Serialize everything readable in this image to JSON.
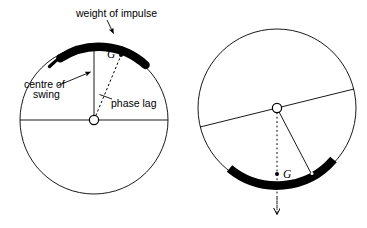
{
  "figure": {
    "background_color": "#ffffff",
    "stroke_color": "#000000",
    "arc_color": "#000000",
    "labels": {
      "weight_of_impulse": "weight of impulse",
      "centre_of_swing_line1": "centre of",
      "centre_of_swing_line2": "swing",
      "phase_lag": "phase lag",
      "centre_of_mass_left": "G",
      "centre_of_mass_right": "G"
    },
    "left_diagram": {
      "name": "upright-flywheel",
      "circle": {
        "cx": 94,
        "cy": 120,
        "r": 74
      },
      "hub": {
        "cx": 94,
        "cy": 120,
        "r": 4.6
      },
      "horizontal_diameter": {
        "x1": 20,
        "y1": 120,
        "x2": 168,
        "y2": 120
      },
      "vertical_radius": {
        "x1": 94,
        "y1": 120,
        "x2": 94,
        "y2": 46
      },
      "impulse_arc": {
        "start_deg": 118,
        "end_deg": 42,
        "thickness": 8
      },
      "g_dot": {
        "cx": 121,
        "cy": 55,
        "r": 2.0
      },
      "g_label": {
        "x": 107,
        "y": 58
      },
      "phase_lag_dashed": {
        "x1": 94,
        "y1": 120,
        "x2": 121,
        "y2": 55
      },
      "phase_lag_tick": {
        "x1": 100,
        "y1": 95,
        "x2": 112,
        "y2": 99
      },
      "weight_label": {
        "x": 76,
        "y": 17
      },
      "weight_arrow": {
        "x1": 108,
        "y1": 20,
        "x2": 114,
        "y2": 34
      },
      "centre_label": {
        "x": 24,
        "y": 88
      },
      "centre_arrow": {
        "x1": 58,
        "y1": 85,
        "x2": 91,
        "y2": 72
      },
      "phase_label": {
        "x": 111,
        "y": 107
      }
    },
    "right_diagram": {
      "name": "rotated-flywheel",
      "circle": {
        "cx": 277,
        "cy": 108,
        "r": 79
      },
      "hub": {
        "cx": 277,
        "cy": 108,
        "r": 4.6
      },
      "tilted_diameter": {
        "x1": 200,
        "y1": 127,
        "x2": 354,
        "y2": 89
      },
      "radius_line": {
        "x1": 277,
        "y1": 108,
        "x2": 313,
        "y2": 177
      },
      "impulse_arc": {
        "start_deg": 257,
        "end_deg": 318,
        "thickness": 8
      },
      "arc_dot": {
        "cx": 312,
        "cy": 174,
        "r": 1.6
      },
      "g_dot": {
        "cx": 277,
        "cy": 174,
        "r": 2.0
      },
      "g_label": {
        "x": 282,
        "y": 177
      },
      "dotted_plumb": {
        "x1": 277,
        "y1": 108,
        "x2": 277,
        "y2": 212
      },
      "arrow_tip": {
        "x": 277,
        "y": 218
      }
    }
  }
}
